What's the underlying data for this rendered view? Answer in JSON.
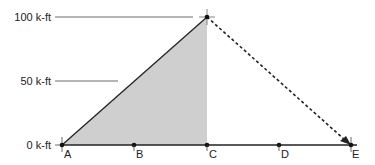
{
  "diagram": {
    "y_labels": [
      {
        "text": "100 k-ft",
        "value": 100
      },
      {
        "text": "50 k-ft",
        "value": 50
      },
      {
        "text": "0 k-ft",
        "value": 0
      }
    ],
    "points": [
      {
        "label": "A"
      },
      {
        "label": "B"
      },
      {
        "label": "C"
      },
      {
        "label": "D"
      },
      {
        "label": "E"
      }
    ],
    "colors": {
      "fill": "#cfcfcf",
      "line": "#222222"
    }
  }
}
